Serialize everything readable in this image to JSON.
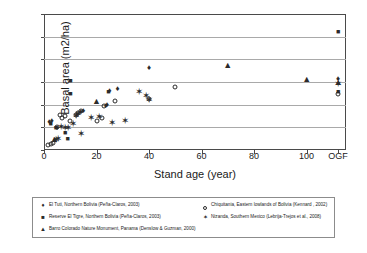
{
  "chart_data": {
    "type": "scatter",
    "title": "",
    "xlabel": "Stand age (year)",
    "ylabel": "Basal area (m2/ha)",
    "xlim": [
      0,
      115
    ],
    "ylim": [
      0,
      60
    ],
    "grid": true,
    "legend_position": "bottom",
    "x_tick_labels": [
      "0",
      "20",
      "40",
      "60",
      "80",
      "100",
      "OGF"
    ],
    "x_tick_values": [
      0,
      20,
      40,
      60,
      80,
      100,
      112
    ],
    "y_tick_labels": [
      "0",
      "10",
      "20",
      "30",
      "40",
      "50",
      "60"
    ],
    "y_tick_values": [
      0,
      10,
      20,
      30,
      40,
      50,
      60
    ],
    "ogf_label": "OGF",
    "series": [
      {
        "name": "El Tuti, Northern Bolivia (Peña-Claros, 2003)",
        "marker": "diamond",
        "points": [
          [
            2.0,
            12.2
          ],
          [
            3.0,
            13.0
          ],
          [
            4.0,
            4.5
          ],
          [
            5.0,
            9.9
          ],
          [
            14.0,
            16.8
          ],
          [
            15.0,
            17.0
          ],
          [
            23.5,
            19.5
          ],
          [
            24.0,
            19.8
          ],
          [
            25.0,
            26.0
          ],
          [
            28.0,
            27.0
          ],
          [
            40.0,
            36.0
          ],
          [
            112.0,
            31.5
          ]
        ]
      },
      {
        "name": "Reserve El Tigre, Northern Bolivia (Peña-Claros, 2003)",
        "marker": "square",
        "points": [
          [
            2.5,
            12.0
          ],
          [
            4.5,
            10.0
          ],
          [
            8.0,
            8.0
          ],
          [
            9.0,
            5.5
          ],
          [
            10.0,
            25.2
          ],
          [
            10.0,
            31.0
          ],
          [
            24.5,
            26.0
          ],
          [
            112.0,
            52.5
          ],
          [
            112.0,
            26.2
          ]
        ]
      },
      {
        "name": "Barro Colorado Nature Monument, Panama (Denslow & Guzman, 2000)",
        "marker": "triangle",
        "points": [
          [
            4.0,
            4.8
          ],
          [
            20.0,
            21.5
          ],
          [
            70.0,
            37.5
          ],
          [
            100.0,
            31.3
          ],
          [
            112.0,
            30.0
          ]
        ]
      },
      {
        "name": "Chiquitania, Eastern lowlands of Bolivia (Kennard, 2002)",
        "marker": "circle",
        "points": [
          [
            1.5,
            2.0
          ],
          [
            2.5,
            2.5
          ],
          [
            3.5,
            3.2
          ],
          [
            5.0,
            10.0
          ],
          [
            6.0,
            15.5
          ],
          [
            7.0,
            14.0
          ],
          [
            8.0,
            15.0
          ],
          [
            10.0,
            13.0
          ],
          [
            12.0,
            15.5
          ],
          [
            13.0,
            16.5
          ],
          [
            14.0,
            17.0
          ],
          [
            20.0,
            13.0
          ],
          [
            22.0,
            14.0
          ],
          [
            23.0,
            19.2
          ],
          [
            27.0,
            21.5
          ],
          [
            40.0,
            22.5
          ],
          [
            50.0,
            28.0
          ],
          [
            112.0,
            24.5
          ]
        ]
      },
      {
        "name": "Nizanda, Southern Mexico (Lebrija-Trejos et al., 2008)",
        "marker": "star",
        "points": [
          [
            4.5,
            4.5
          ],
          [
            5.5,
            5.0
          ],
          [
            6.5,
            10.0
          ],
          [
            8.0,
            9.8
          ],
          [
            9.0,
            9.5
          ],
          [
            11.0,
            11.5
          ],
          [
            12.0,
            15.0
          ],
          [
            13.0,
            16.0
          ],
          [
            14.0,
            7.0
          ],
          [
            18.0,
            14.3
          ],
          [
            21.0,
            14.7
          ],
          [
            26.0,
            12.0
          ],
          [
            31.0,
            13.0
          ],
          [
            36.0,
            25.8
          ],
          [
            39.0,
            24.0
          ],
          [
            40.0,
            22.0
          ],
          [
            112.0,
            29.0
          ]
        ]
      }
    ]
  },
  "legend": {
    "entries": [
      {
        "symbol": "♦",
        "marker": "diamond",
        "label": "El Tuti, Northern Bolivia (Peña-Claros, 2003)"
      },
      {
        "symbol": "○",
        "marker": "circle",
        "label": "Chiquitania, Eastern lowlands of Bolivia (Kennard , 2002)"
      },
      {
        "symbol": "■",
        "marker": "square",
        "label": "Reserve El Tigre, Northern Bolivia (Peña-Claros, 2003)"
      },
      {
        "symbol": "✶",
        "marker": "star",
        "label": "Nizanda, Southern Mexico (Lebrija-Trejos et al., 2008)"
      },
      {
        "symbol": "▲",
        "marker": "triangle",
        "label": "Barro Colorado Nature Monument, Panama (Denslow & Guzman, 2000)"
      }
    ]
  }
}
